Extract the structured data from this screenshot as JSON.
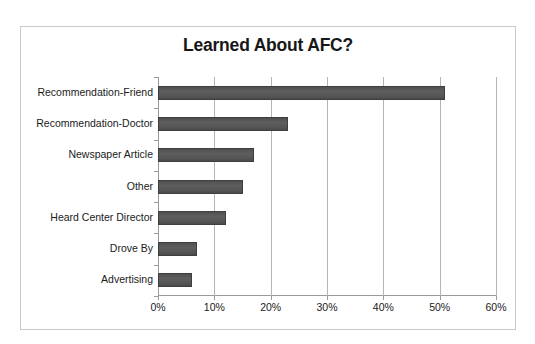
{
  "chart_data": {
    "type": "bar",
    "orientation": "horizontal",
    "title": "Learned About AFC?",
    "xlabel": "",
    "ylabel": "",
    "categories": [
      "Recommendation-Friend",
      "Recommendation-Doctor",
      "Newspaper Article",
      "Other",
      "Heard Center Director",
      "Drove By",
      "Advertising"
    ],
    "values": [
      51,
      23,
      17,
      15,
      12,
      7,
      6
    ],
    "value_unit": "%",
    "xlim": [
      0,
      60
    ],
    "xticks": [
      0,
      10,
      20,
      30,
      40,
      50,
      60
    ],
    "xtick_labels": [
      "0%",
      "10%",
      "20%",
      "30%",
      "40%",
      "50%",
      "60%"
    ],
    "grid": "vertical",
    "legend": "none",
    "bar_color": "#595959",
    "axis_color": "#9a9a9a",
    "gridline_color": "#b4b4b4",
    "frame_color": "#c9c9c9",
    "background_color": "#ffffff"
  }
}
